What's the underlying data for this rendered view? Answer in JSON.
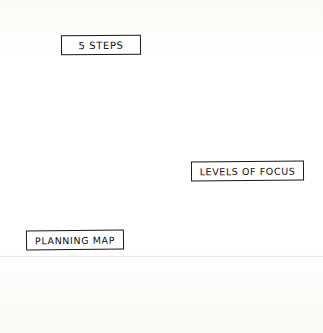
{
  "diagram": {
    "style": "hand-drawn sketch, black ink on white paper",
    "background_color": "#fdfdfc",
    "ink_color": "#141414",
    "fill_gray": "#c9c9c9",
    "outer_circle": {
      "name": "outer-circle",
      "center_x": 160,
      "center_y": 162,
      "radius": 141
    },
    "hub": {
      "x": 160,
      "y": 166
    },
    "divider_angles_deg": [
      200,
      340,
      90
    ],
    "sections": [
      {
        "id": "top",
        "label": "5 STEPS",
        "icon": "donut-chart-icon",
        "icon_segments": 5,
        "icon_center_x": 167,
        "icon_center_y": 97,
        "icon_radius": 38,
        "icon_hole_radius": 14
      },
      {
        "id": "left",
        "label": "PLANNING MAP",
        "icon": "diamond-levels-icon",
        "icon_levels": 5,
        "icon_center_x": 87,
        "icon_center_y": 181,
        "icon_half_width": 24,
        "icon_half_height": 45
      },
      {
        "id": "right",
        "label": "LEVELS OF FOCUS",
        "icon": "pyramid-levels-icon",
        "icon_levels": 5,
        "icon_apex_x": 214,
        "icon_apex_y": 198,
        "icon_base_y": 258,
        "icon_half_base": 42
      }
    ]
  },
  "labels": {
    "top": "5 STEPS",
    "right": "LEVELS OF FOCUS",
    "left": "PLANNING MAP"
  }
}
